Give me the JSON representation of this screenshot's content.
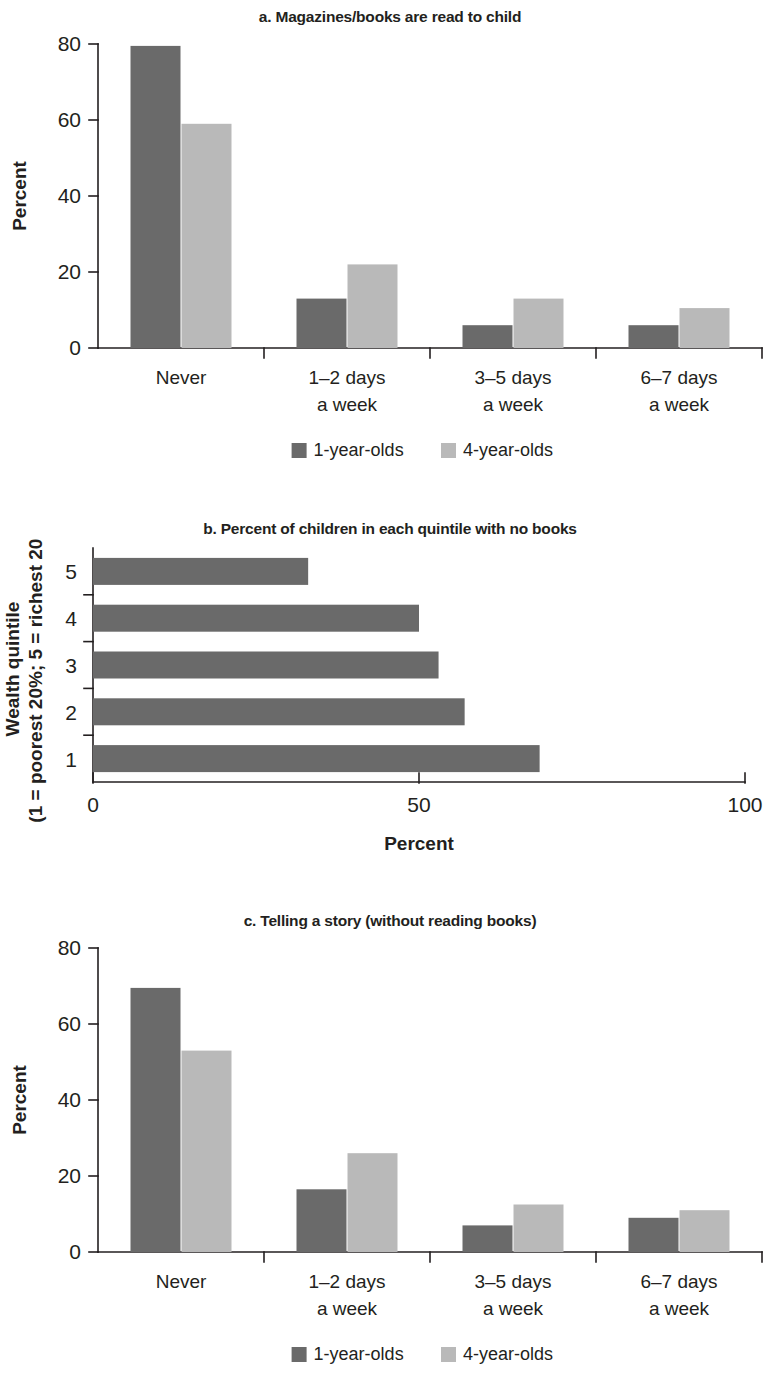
{
  "figure": {
    "panels": [
      {
        "id": "a",
        "title": "a. Magazines/books are read to child"
      },
      {
        "id": "b",
        "title": "b. Percent of children in each quintile with no books"
      },
      {
        "id": "c",
        "title": "c. Telling a story (without reading books)"
      }
    ],
    "legend": {
      "series1_label": "1-year-olds",
      "series2_label": "4-year-olds",
      "series1_color": "#6a6a6a",
      "series2_color": "#b9b9b9"
    }
  },
  "chart_data": [
    {
      "type": "bar",
      "title": "a. Magazines/books are read to child",
      "xlabel": "",
      "ylabel": "Percent",
      "ylim": [
        0,
        80
      ],
      "yticks": [
        0,
        20,
        40,
        60,
        80
      ],
      "ytick_labels": [
        "0",
        "20",
        "40",
        "60",
        "80"
      ],
      "grid": false,
      "legend_position": "bottom",
      "categories": [
        "Never",
        "1–2 days a week",
        "3–5 days a week",
        "6–7 days a week"
      ],
      "category_lines": [
        [
          "Never",
          ""
        ],
        [
          "1–2 days",
          "a week"
        ],
        [
          "3–5 days",
          "a week"
        ],
        [
          "6–7 days",
          "a week"
        ]
      ],
      "series": [
        {
          "name": "1-year-olds",
          "color": "#6a6a6a",
          "values": [
            79.5,
            13.0,
            6.0,
            6.0
          ]
        },
        {
          "name": "4-year-olds",
          "color": "#b9b9b9",
          "values": [
            59.0,
            22.0,
            13.0,
            10.5
          ]
        }
      ]
    },
    {
      "type": "bar",
      "orientation": "horizontal",
      "title": "b. Percent of children in each quintile with no books",
      "xlabel": "Percent",
      "ylabel": "Wealth quintile (1 = poorest 20%; 5 = richest 20%)",
      "ylabel_lines": [
        "Wealth quintile",
        "(1 = poorest 20%; 5 = richest 20%)"
      ],
      "xlim": [
        0,
        100
      ],
      "xticks": [
        0,
        50,
        100
      ],
      "xtick_labels": [
        "0",
        "50",
        "100"
      ],
      "grid": false,
      "legend_position": "none",
      "categories": [
        "1",
        "2",
        "3",
        "4",
        "5"
      ],
      "series": [
        {
          "name": "Percent with no books",
          "color": "#6a6a6a",
          "values": [
            68.5,
            57.0,
            53.0,
            50.0,
            33.0
          ]
        }
      ]
    },
    {
      "type": "bar",
      "title": "c. Telling a story (without reading books)",
      "xlabel": "",
      "ylabel": "Percent",
      "ylim": [
        0,
        80
      ],
      "yticks": [
        0,
        20,
        40,
        60,
        80
      ],
      "ytick_labels": [
        "0",
        "20",
        "40",
        "60",
        "80"
      ],
      "grid": false,
      "legend_position": "bottom",
      "categories": [
        "Never",
        "1–2 days a week",
        "3–5 days a week",
        "6–7 days a week"
      ],
      "category_lines": [
        [
          "Never",
          ""
        ],
        [
          "1–2 days",
          "a week"
        ],
        [
          "3–5 days",
          "a week"
        ],
        [
          "6–7 days",
          "a week"
        ]
      ],
      "series": [
        {
          "name": "1-year-olds",
          "color": "#6a6a6a",
          "values": [
            69.5,
            16.5,
            7.0,
            9.0
          ]
        },
        {
          "name": "4-year-olds",
          "color": "#b9b9b9",
          "values": [
            53.0,
            26.0,
            12.5,
            11.0
          ]
        }
      ]
    }
  ]
}
